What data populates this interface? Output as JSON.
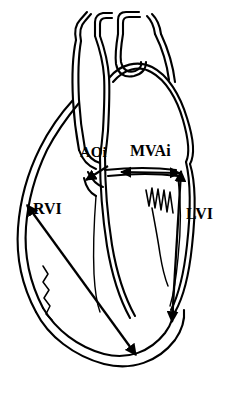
{
  "figure": {
    "title": "Heart anatomical line drawing with ventricular and valve index measurement arrows",
    "background_color": "#ffffff",
    "stroke_color": "#000000",
    "labels": [
      {
        "id": "aoi",
        "text": "AOi",
        "meaning": "aortic-outflow-index",
        "x": 80,
        "y": 145
      },
      {
        "id": "mvai",
        "text": "MVAi",
        "meaning": "mitral-valve-annulus-index",
        "x": 130,
        "y": 143
      },
      {
        "id": "rvi",
        "text": "RVI",
        "meaning": "right-ventricle-index",
        "x": 33,
        "y": 201
      },
      {
        "id": "lvi",
        "text": "LVI",
        "meaning": "left-ventricle-index",
        "x": 186,
        "y": 206
      }
    ],
    "measurement_arrows": [
      {
        "id": "aoi-arrow",
        "label": "AOi",
        "heads": "single",
        "direction": "down-left"
      },
      {
        "id": "mvai-arrow",
        "label": "MVAi",
        "heads": "double",
        "direction": "horizontal"
      },
      {
        "id": "rvi-arrow",
        "label": "RVI",
        "heads": "double",
        "direction": "diagonal-down-right"
      },
      {
        "id": "lvi-arrow",
        "label": "LVI",
        "heads": "double",
        "direction": "vertical-down"
      }
    ],
    "structures": [
      "aortic-arch",
      "brachiocephalic-branch",
      "left-carotid-branch",
      "left-subclavian-branch",
      "pulmonary-artery",
      "left-ventricle-wall",
      "right-ventricle-wall",
      "cardiac-apex",
      "mitral-valve-chordae",
      "right-ventricle-trabeculation"
    ]
  }
}
